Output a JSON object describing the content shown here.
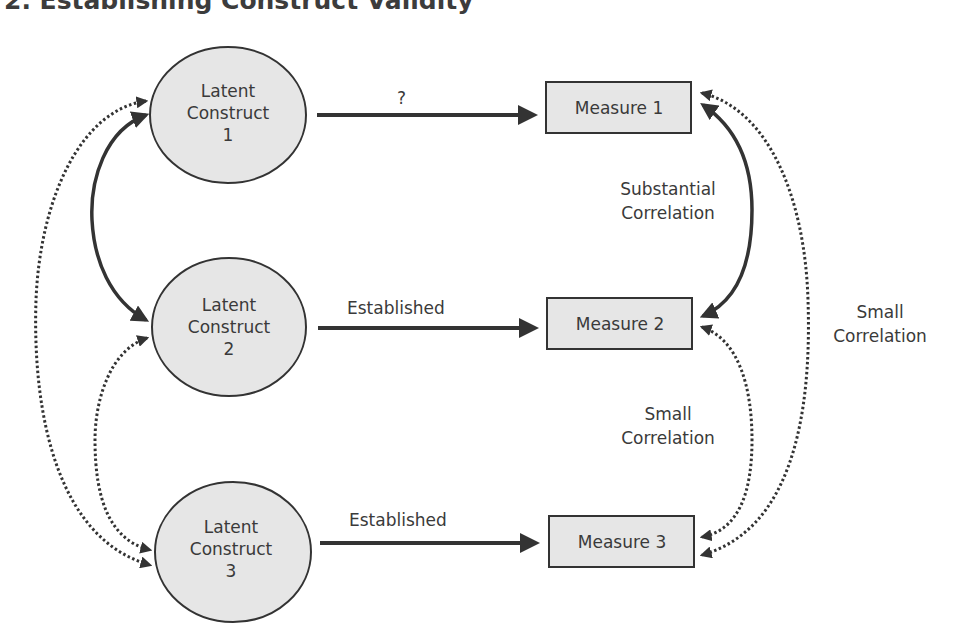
{
  "title": "2. Establishing Construct Validity",
  "constructs": [
    {
      "line1": "Latent",
      "line2": "Construct",
      "line3": "1"
    },
    {
      "line1": "Latent",
      "line2": "Construct",
      "line3": "2"
    },
    {
      "line1": "Latent",
      "line2": "Construct",
      "line3": "3"
    }
  ],
  "measures": [
    {
      "label": "Measure 1"
    },
    {
      "label": "Measure 2"
    },
    {
      "label": "Measure 3"
    }
  ],
  "edges": {
    "c1_m1": "?",
    "c2_m2": "Established",
    "c3_m3": "Established",
    "m1_m2": {
      "line1": "Substantial",
      "line2": "Correlation"
    },
    "m2_m3": {
      "line1": "Small",
      "line2": "Correlation"
    },
    "m1_m3": {
      "line1": "Small",
      "line2": "Correlation"
    }
  },
  "colors": {
    "node_fill": "#e6e6e6",
    "stroke": "#333333",
    "text": "#3a3a3a"
  }
}
